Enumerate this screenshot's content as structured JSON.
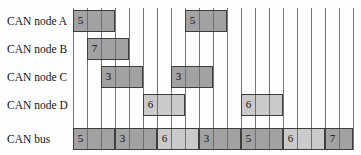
{
  "figure": {
    "type": "gantt-timing-diagram",
    "title": "",
    "time_slots": 20,
    "slot_unit": "time slot (unlabeled axis)",
    "colors": {
      "dark_fill": "#a2a2a2",
      "light_fill": "#cacaca",
      "bar_border": "#3e3e3e",
      "grid_line": "#767676",
      "background": "#fefefe",
      "text": "#141414"
    },
    "rows": [
      {
        "label": "CAN node A",
        "bars": [
          {
            "start": 0,
            "len": 3,
            "value": "5",
            "tone": "dark"
          },
          {
            "start": 8,
            "len": 3,
            "value": "5",
            "tone": "dark"
          }
        ]
      },
      {
        "label": "CAN node B",
        "bars": [
          {
            "start": 1,
            "len": 3,
            "value": "7",
            "tone": "dark"
          }
        ]
      },
      {
        "label": "CAN node C",
        "bars": [
          {
            "start": 2,
            "len": 3,
            "value": "3",
            "tone": "dark"
          },
          {
            "start": 7,
            "len": 3,
            "value": "3",
            "tone": "dark"
          }
        ]
      },
      {
        "label": "CAN node D",
        "bars": [
          {
            "start": 5,
            "len": 3,
            "value": "6",
            "tone": "light"
          },
          {
            "start": 12,
            "len": 3,
            "value": "6",
            "tone": "light"
          }
        ]
      },
      {
        "label": "CAN bus",
        "bars": [
          {
            "start": 0,
            "len": 3,
            "value": "5",
            "tone": "dark"
          },
          {
            "start": 3,
            "len": 3,
            "value": "3",
            "tone": "dark"
          },
          {
            "start": 6,
            "len": 3,
            "value": "6",
            "tone": "light"
          },
          {
            "start": 9,
            "len": 3,
            "value": "3",
            "tone": "dark"
          },
          {
            "start": 12,
            "len": 3,
            "value": "5",
            "tone": "dark"
          },
          {
            "start": 15,
            "len": 3,
            "value": "6",
            "tone": "light"
          },
          {
            "start": 18,
            "len": 2,
            "value": "7",
            "tone": "dark"
          }
        ]
      }
    ]
  }
}
